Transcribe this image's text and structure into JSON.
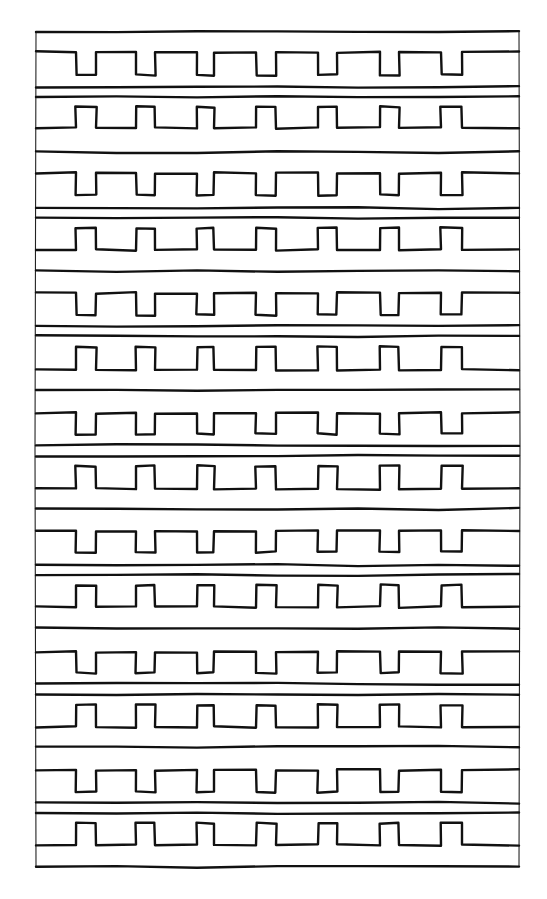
{
  "drawing": {
    "kind": "hand-drawn square-wave (meander) band pattern",
    "ink_color": "#111111",
    "background_color": "#ffffff",
    "frame": {
      "left": 36,
      "right": 519,
      "top": 32,
      "bottom": 867
    },
    "notch_columns": [
      [
        76,
        96
      ],
      [
        136,
        155
      ],
      [
        197,
        214
      ],
      [
        256,
        276
      ],
      [
        318,
        337
      ],
      [
        380,
        399
      ],
      [
        441,
        462
      ]
    ],
    "separator_lines_y": [
      32,
      87,
      97,
      152,
      208,
      218,
      271,
      326,
      336,
      390,
      445,
      456,
      509,
      565,
      575,
      628,
      684,
      695,
      747,
      803,
      813,
      867
    ],
    "wave_rows": [
      {
        "type": "down-notch",
        "high": 52,
        "low": 75
      },
      {
        "type": "up-tab",
        "high": 107,
        "low": 128
      },
      {
        "type": "down-notch",
        "high": 173,
        "low": 195
      },
      {
        "type": "up-tab",
        "high": 228,
        "low": 250
      },
      {
        "type": "down-notch",
        "high": 293,
        "low": 315
      },
      {
        "type": "up-tab",
        "high": 347,
        "low": 370
      },
      {
        "type": "down-notch",
        "high": 413,
        "low": 434
      },
      {
        "type": "up-tab",
        "high": 466,
        "low": 489
      },
      {
        "type": "down-notch",
        "high": 531,
        "low": 552
      },
      {
        "type": "up-tab",
        "high": 585,
        "low": 607
      },
      {
        "type": "down-notch",
        "high": 652,
        "low": 673
      },
      {
        "type": "up-tab",
        "high": 705,
        "low": 727
      },
      {
        "type": "down-notch",
        "high": 770,
        "low": 792
      },
      {
        "type": "up-tab",
        "high": 823,
        "low": 845
      }
    ]
  }
}
